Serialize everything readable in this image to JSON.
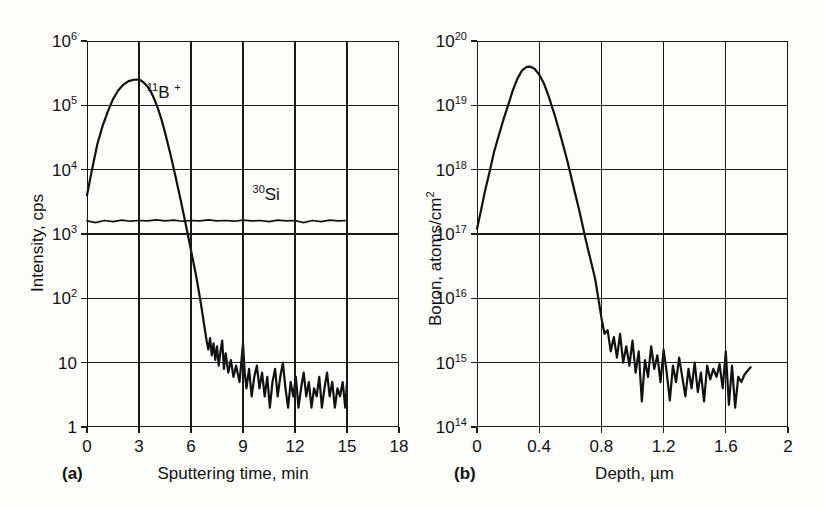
{
  "figure": {
    "caption_tag_a": "(a)",
    "caption_tag_b": "(b)"
  },
  "panel_a": {
    "tag": "(a)",
    "xlabel": "Sputtering time, min",
    "ylabel": "Intensity, cps",
    "xticks": [
      "0",
      "3",
      "6",
      "9",
      "12",
      "15",
      "18"
    ],
    "yticks": [
      "10",
      "10",
      "10",
      "10",
      "10",
      "10",
      "1"
    ],
    "yexp": [
      "6",
      "5",
      "4",
      "3",
      "2",
      "",
      ""
    ],
    "ylabels_plain": [
      "10",
      "10",
      "10",
      "10",
      "10",
      "10",
      "1"
    ],
    "annotations": [
      {
        "name": "boron-11-trace-label",
        "pre": "11",
        "text": "B",
        "post": "+"
      },
      {
        "name": "silicon-30-trace-label",
        "pre": "30",
        "text": "Si",
        "post": ""
      }
    ]
  },
  "panel_b": {
    "tag": "(b)",
    "xlabel": "Depth, µm",
    "ylabel_main": "Boron, atoms/cm",
    "ylabel_exp": "2",
    "xticks": [
      "0",
      "0.4",
      "0.8",
      "1.2",
      "1.6",
      "2"
    ],
    "yexp": [
      "20",
      "19",
      "18",
      "17",
      "16",
      "15",
      "14"
    ]
  },
  "chart_data": [
    {
      "type": "line",
      "id": "panel-a",
      "title": "",
      "panel_tag": "(a)",
      "xlabel": "Sputtering time, min",
      "ylabel": "Intensity, cps",
      "xlim": [
        0,
        18
      ],
      "ylim": [
        1,
        1000000
      ],
      "yscale": "log",
      "xticks": [
        0,
        3,
        6,
        9,
        12,
        15,
        18
      ],
      "yticks": [
        1,
        10,
        100,
        1000,
        10000,
        100000,
        1000000
      ],
      "ytick_labels": [
        "1",
        "10",
        "10^2",
        "10^3",
        "10^4",
        "10^5",
        "10^6"
      ],
      "grid": true,
      "legend": "none",
      "annotations": [
        {
          "label": "11B+",
          "x": 3.6,
          "y": 120000
        },
        {
          "label": "30Si",
          "x": 10.2,
          "y": 3000
        }
      ],
      "series": [
        {
          "name": "11B+",
          "comment": "boron-11 secondary ion signal: rises from 4e3 at t=0 to peak 2.5e5 at t=3, falls steeply, noise floor ~4 cps after t=8",
          "x": [
            0.0,
            0.15,
            0.35,
            0.6,
            0.9,
            1.2,
            1.5,
            1.8,
            2.1,
            2.4,
            2.7,
            2.9,
            3.0,
            3.15,
            3.3,
            3.5,
            3.7,
            3.9,
            4.1,
            4.3,
            4.5,
            4.8,
            5.1,
            5.4,
            5.7,
            6.0,
            6.3,
            6.55,
            6.75,
            6.9,
            7.0,
            7.1,
            7.2,
            7.3,
            7.4,
            7.5,
            7.6,
            7.7,
            7.8,
            7.9,
            8.0,
            8.15,
            8.3,
            8.45,
            8.6,
            8.8,
            9.0,
            9.1,
            9.2,
            9.35,
            9.5,
            9.65,
            9.8,
            9.95,
            10.1,
            10.25,
            10.4,
            10.55,
            10.7,
            10.85,
            11.0,
            11.15,
            11.3,
            11.45,
            11.6,
            11.75,
            11.9,
            12.05,
            12.2,
            12.35,
            12.5,
            12.65,
            12.8,
            12.95,
            13.1,
            13.25,
            13.4,
            13.55,
            13.7,
            13.85,
            14.0,
            14.15,
            14.3,
            14.45,
            14.6,
            14.75,
            14.9,
            15.0
          ],
          "y": [
            4000,
            6500,
            12000,
            25000,
            48000,
            80000,
            125000,
            170000,
            210000,
            238000,
            250000,
            252000,
            250000,
            240000,
            222000,
            195000,
            160000,
            122000,
            88000,
            60000,
            38000,
            18000,
            8000,
            3400,
            1400,
            560,
            220,
            90,
            40,
            22,
            16,
            24,
            13,
            20,
            11,
            18,
            9,
            15,
            22,
            8,
            14,
            7,
            11,
            6,
            9,
            5,
            20,
            7,
            4,
            8,
            3,
            6,
            9,
            4,
            7,
            3,
            6,
            2,
            5,
            8,
            3,
            6,
            10,
            4,
            2,
            5,
            3,
            6,
            2,
            4,
            7,
            3,
            5,
            2,
            4,
            3,
            6,
            2,
            4,
            7,
            3,
            5,
            2,
            4,
            3,
            5,
            2,
            5
          ]
        },
        {
          "name": "30Si",
          "comment": "silicon-30 matrix signal: flat plateau near 1.6e3 cps with small ripple, from t=0 to t=15",
          "x": [
            0,
            0.5,
            1.0,
            1.5,
            2.0,
            2.5,
            3.0,
            3.5,
            4.0,
            4.5,
            5.0,
            5.5,
            6.0,
            6.5,
            7.0,
            7.5,
            8.0,
            8.5,
            9.0,
            9.5,
            10.0,
            10.5,
            11.0,
            11.5,
            12.0,
            12.5,
            13.0,
            13.5,
            14.0,
            14.5,
            15.0
          ],
          "y": [
            1600,
            1500,
            1620,
            1560,
            1640,
            1580,
            1620,
            1600,
            1660,
            1600,
            1640,
            1580,
            1620,
            1600,
            1660,
            1600,
            1620,
            1580,
            1640,
            1600,
            1620,
            1560,
            1640,
            1600,
            1620,
            1500,
            1620,
            1560,
            1640,
            1600,
            1620
          ]
        }
      ]
    },
    {
      "type": "line",
      "id": "panel-b",
      "title": "",
      "panel_tag": "(b)",
      "xlabel": "Depth, µm",
      "ylabel": "Boron, atoms/cm^2",
      "xlim": [
        0,
        2
      ],
      "ylim": [
        100000000000000.0,
        1e+20
      ],
      "yscale": "log",
      "xticks": [
        0,
        0.4,
        0.8,
        1.2,
        1.6,
        2
      ],
      "yticks": [
        100000000000000.0,
        1000000000000000.0,
        1e+16,
        1e+17,
        1e+18,
        1e+19,
        1e+20
      ],
      "ytick_labels": [
        "10^14",
        "10^15",
        "10^16",
        "10^17",
        "10^18",
        "10^19",
        "10^20"
      ],
      "grid": true,
      "legend": "none",
      "series": [
        {
          "name": "Boron depth profile",
          "comment": "converted depth profile: 1.2e17 at surface, peak 4e19 at 0.33 um, steep fall, detection-limit noise ~8e14 beyond 0.9 um",
          "x": [
            0.0,
            0.02,
            0.05,
            0.08,
            0.11,
            0.14,
            0.17,
            0.2,
            0.23,
            0.26,
            0.29,
            0.32,
            0.34,
            0.37,
            0.4,
            0.43,
            0.46,
            0.5,
            0.54,
            0.58,
            0.62,
            0.66,
            0.7,
            0.73,
            0.76,
            0.78,
            0.8,
            0.82,
            0.84,
            0.86,
            0.88,
            0.9,
            0.92,
            0.94,
            0.96,
            0.98,
            1.0,
            1.02,
            1.04,
            1.06,
            1.08,
            1.1,
            1.12,
            1.14,
            1.16,
            1.18,
            1.2,
            1.22,
            1.24,
            1.26,
            1.28,
            1.3,
            1.32,
            1.34,
            1.36,
            1.38,
            1.4,
            1.42,
            1.44,
            1.46,
            1.48,
            1.5,
            1.52,
            1.54,
            1.56,
            1.58,
            1.6,
            1.62,
            1.64,
            1.66,
            1.68,
            1.7,
            1.72,
            1.74,
            1.76
          ],
          "y": [
            1.2e+17,
            2e+17,
            4.5e+17,
            9e+17,
            1.9e+18,
            3.4e+18,
            6e+18,
            1e+19,
            1.7e+19,
            2.6e+19,
            3.5e+19,
            3.95e+19,
            4e+19,
            3.7e+19,
            3e+19,
            2.2e+19,
            1.4e+19,
            7e+18,
            3.2e+18,
            1.4e+18,
            5.5e+17,
            2.2e+17,
            8e+16,
            4e+16,
            2e+16,
            1e+16,
            5000000000000000.0,
            2800000000000000.0,
            3200000000000000.0,
            1500000000000000.0,
            2500000000000000.0,
            1200000000000000.0,
            2800000000000000.0,
            1000000000000000.0,
            1800000000000000.0,
            900000000000000.0,
            2200000000000000.0,
            700000000000000.0,
            1500000000000000.0,
            250000000000000.0,
            1100000000000000.0,
            600000000000000.0,
            1800000000000000.0,
            800000000000000.0,
            1300000000000000.0,
            500000000000000.0,
            1600000000000000.0,
            700000000000000.0,
            260000000000000.0,
            900000000000000.0,
            500000000000000.0,
            1200000000000000.0,
            600000000000000.0,
            300000000000000.0,
            800000000000000.0,
            400000000000000.0,
            1000000000000000.0,
            350000000000000.0,
            700000000000000.0,
            250000000000000.0,
            900000000000000.0,
            550000000000000.0,
            800000000000000.0,
            600000000000000.0,
            950000000000000.0,
            400000000000000.0,
            1500000000000000.0,
            220000000000000.0,
            900000000000000.0,
            200000000000000.0,
            600000000000000.0,
            500000000000000.0,
            650000000000000.0,
            750000000000000.0,
            850000000000000.0
          ]
        }
      ]
    }
  ]
}
